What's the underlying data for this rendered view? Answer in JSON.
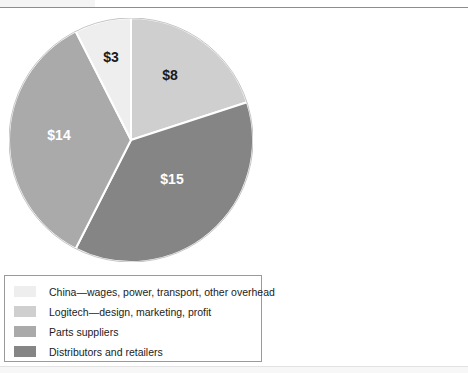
{
  "chart_data": {
    "type": "pie",
    "title": "",
    "subtitle": "",
    "xlabel": "",
    "ylabel": "",
    "unit": "$",
    "total": 40,
    "grid": false,
    "legend_position": "bottom-left",
    "start_angle_deg": 0,
    "direction": "clockwise",
    "categories": [
      "China—wages, power, transport, other overhead",
      "Logitech—design, marketing, profit",
      "Parts suppliers",
      "Distributors and retailers"
    ],
    "values": [
      3,
      8,
      14,
      15
    ],
    "data_labels": [
      "$3",
      "$8",
      "$14",
      "$15"
    ],
    "colors": [
      "#eeeeee",
      "#cfcfcf",
      "#aaaaaa",
      "#858585"
    ],
    "slices": [
      {
        "label": "$8",
        "value": 8,
        "category": "Logitech—design, marketing, profit",
        "color": "#cfcfcf",
        "label_color": "#1a1a1a",
        "start_deg": 0,
        "sweep_deg": 72,
        "label_x": 170,
        "label_y": 80
      },
      {
        "label": "$15",
        "value": 15,
        "category": "Distributors and retailers",
        "color": "#858585",
        "label_color": "#ffffff",
        "start_deg": 72,
        "sweep_deg": 135,
        "label_x": 172,
        "label_y": 184
      },
      {
        "label": "$14",
        "value": 14,
        "category": "Parts suppliers",
        "color": "#aaaaaa",
        "label_color": "#ffffff",
        "start_deg": 207,
        "sweep_deg": 126,
        "label_x": 59,
        "label_y": 140
      },
      {
        "label": "$3",
        "value": 3,
        "category": "China—wages, power, transport, other overhead",
        "color": "#eeeeee",
        "label_color": "#1a1a1a",
        "start_deg": 333,
        "sweep_deg": 27,
        "label_x": 111,
        "label_y": 62
      }
    ]
  },
  "pie": {
    "center_x": 131,
    "center_y": 140,
    "radius": 122,
    "separator_color": "#ffffff",
    "separator_width": 2
  },
  "legend": {
    "border_color": "#9a9a9a",
    "items": [
      {
        "label": "China—wages, power, transport, other overhead",
        "color": "#eeeeee"
      },
      {
        "label": "Logitech—design, marketing, profit",
        "color": "#cfcfcf"
      },
      {
        "label": "Parts suppliers",
        "color": "#aaaaaa"
      },
      {
        "label": "Distributors and retailers",
        "color": "#858585"
      }
    ]
  }
}
